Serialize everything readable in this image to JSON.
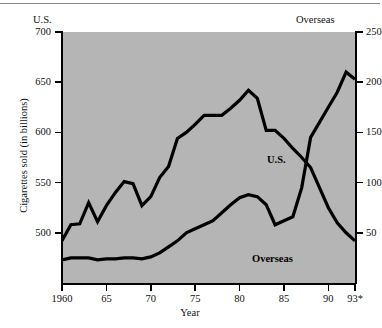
{
  "figure": {
    "left_header": "U.S.",
    "right_header": "Overseas",
    "ylabel_left": "Cigarettes sold (in billions)",
    "xlabel": "Year",
    "series_label_us": "U.S.",
    "series_label_overseas": "Overseas",
    "plot_background": "#b5b5b5",
    "line_color": "#000000"
  },
  "chart_data": {
    "type": "line",
    "title": "",
    "xlabel": "Year",
    "ylabel": "Cigarettes sold (in billions)",
    "ylabel_right": "Overseas",
    "grid": false,
    "legend": "inline-labels",
    "xlim": [
      1960,
      1993
    ],
    "xticks": [
      1960,
      1965,
      1970,
      1975,
      1980,
      1985,
      1990,
      1993
    ],
    "xticklabels": [
      "1960",
      "65",
      "70",
      "75",
      "80",
      "85",
      "90",
      "93*"
    ],
    "left_axis": {
      "name": "U.S.",
      "ylim": [
        450,
        700
      ],
      "yticks": [
        500,
        550,
        600,
        650,
        700
      ],
      "yticklabels": [
        "500",
        "550",
        "600",
        "650",
        "700"
      ]
    },
    "right_axis": {
      "name": "Overseas",
      "ylim": [
        0,
        250
      ],
      "yticks": [
        50,
        100,
        150,
        200,
        250
      ],
      "yticklabels": [
        "50",
        "100",
        "150",
        "200",
        "250"
      ]
    },
    "x": [
      1960,
      1961,
      1962,
      1963,
      1964,
      1965,
      1966,
      1967,
      1968,
      1969,
      1970,
      1971,
      1972,
      1973,
      1974,
      1975,
      1976,
      1977,
      1978,
      1979,
      1980,
      1981,
      1982,
      1983,
      1984,
      1985,
      1986,
      1987,
      1988,
      1989,
      1990,
      1991,
      1992,
      1993
    ],
    "series": [
      {
        "name": "U.S.",
        "axis": "left",
        "units": "billions of cigarettes",
        "values": [
          492,
          508,
          509,
          530,
          511,
          527,
          540,
          551,
          549,
          527,
          536,
          555,
          566,
          594,
          600,
          608,
          617,
          617,
          617,
          624,
          632,
          642,
          634,
          602,
          602,
          594,
          584,
          575,
          565,
          545,
          525,
          510,
          500,
          492
        ]
      },
      {
        "name": "Overseas",
        "axis": "right",
        "units": "billions of cigarettes",
        "values": [
          23,
          25,
          25,
          25,
          23,
          24,
          24,
          25,
          25,
          24,
          26,
          30,
          36,
          42,
          50,
          54,
          58,
          62,
          70,
          78,
          85,
          88,
          86,
          78,
          58,
          62,
          66,
          95,
          145,
          160,
          175,
          190,
          210,
          203
        ]
      }
    ]
  }
}
